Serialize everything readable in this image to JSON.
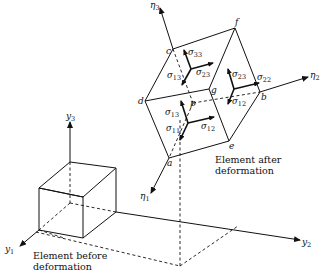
{
  "diagram": {
    "captions": {
      "before": [
        "Element before",
        "deformation"
      ],
      "after": [
        "Element after",
        "deformation"
      ]
    },
    "undeformed_axes": {
      "y1": {
        "base": "y",
        "sub": "1"
      },
      "y2": {
        "base": "y",
        "sub": "2"
      },
      "y3": {
        "base": "y",
        "sub": "3"
      }
    },
    "deformed_axes": {
      "eta1": {
        "base": "η",
        "sub": "1"
      },
      "eta2": {
        "base": "η",
        "sub": "2"
      },
      "eta3": {
        "base": "η",
        "sub": "3"
      }
    },
    "vertices": {
      "a": "a",
      "b": "b",
      "c": "c",
      "d": "d",
      "e": "e",
      "f": "f",
      "g": "g",
      "p": "p"
    },
    "stresses": {
      "face_c": [
        {
          "base": "σ",
          "sub": "33"
        },
        {
          "base": "σ",
          "sub": "13"
        },
        {
          "base": "σ",
          "sub": "23"
        }
      ],
      "face_b": [
        {
          "base": "σ",
          "sub": "23"
        },
        {
          "base": "σ",
          "sub": "22"
        },
        {
          "base": "σ",
          "sub": "12"
        }
      ],
      "face_a": [
        {
          "base": "σ",
          "sub": "13"
        },
        {
          "base": "σ",
          "sub": "11"
        },
        {
          "base": "σ",
          "sub": "12"
        }
      ]
    }
  }
}
